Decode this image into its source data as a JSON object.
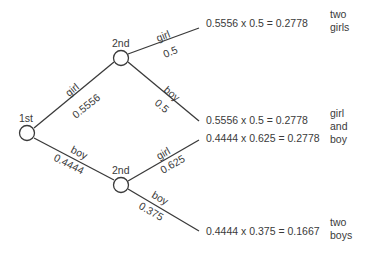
{
  "nodes": {
    "first": {
      "label": "1st"
    },
    "second_upper": {
      "label": "2nd"
    },
    "second_lower": {
      "label": "2nd"
    }
  },
  "branches": {
    "first_girl": {
      "event": "girl",
      "prob": "0.5556"
    },
    "first_boy": {
      "event": "boy",
      "prob": "0.4444"
    },
    "upper_girl": {
      "event": "girl",
      "prob": "0.5"
    },
    "upper_boy": {
      "event": "boy",
      "prob": "0.5"
    },
    "lower_girl": {
      "event": "girl",
      "prob": "0.625"
    },
    "lower_boy": {
      "event": "boy",
      "prob": "0.375"
    }
  },
  "results": [
    {
      "calc": "0.5556 x 0.5 = 0.2778"
    },
    {
      "calc": "0.5556 x 0.5 = 0.2778"
    },
    {
      "calc": "0.4444 x 0.625 = 0.2778"
    },
    {
      "calc": "0.4444 x 0.375 = 0.1667"
    }
  ],
  "outcomes": {
    "two_girls": [
      "two",
      "girls"
    ],
    "girl_and_boy": [
      "girl",
      "and",
      "boy"
    ],
    "two_boys": [
      "two",
      "boys"
    ]
  },
  "colors": {
    "line": "#3a3a3a",
    "text": "#3a3a3a",
    "background": "#ffffff"
  }
}
